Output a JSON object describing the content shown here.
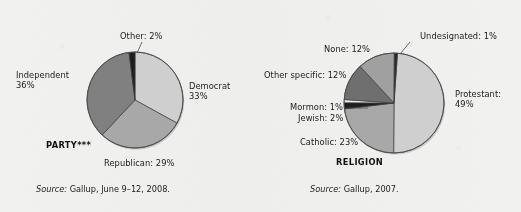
{
  "page": {
    "background_color": "#f1f1ef",
    "text_color": "#1b1b1b"
  },
  "charts": [
    {
      "id": "party",
      "title": "PARTY***",
      "source_prefix": "Source:",
      "source_text": "Gallup, June 9–12, 2008.",
      "center": {
        "x": 135,
        "y": 100
      },
      "radius": 48,
      "start_angle": -90,
      "slices": [
        {
          "label": "Democrat",
          "value": 33,
          "display": "Democrat",
          "percent_text": "33%",
          "color": "#cfcfcf"
        },
        {
          "label": "Republican",
          "value": 29,
          "display": "Republican: 29%",
          "percent_text": "29%",
          "color": "#a8a8a8"
        },
        {
          "label": "Independent",
          "value": 36,
          "display": "Independent",
          "percent_text": "36%",
          "color": "#808080"
        },
        {
          "label": "Other",
          "value": 2,
          "display": "Other: 2%",
          "percent_text": "2%",
          "color": "#1e1e1e"
        }
      ]
    },
    {
      "id": "religion",
      "title": "RELIGION",
      "source_prefix": "Source:",
      "source_text": "Gallup, 2007.",
      "center": {
        "x": 394,
        "y": 103
      },
      "radius": 50,
      "start_angle": -86,
      "slices": [
        {
          "label": "Protestant",
          "value": 49,
          "display": "Protestant:",
          "percent_text": "49%",
          "color": "#cfcfcf"
        },
        {
          "label": "Catholic",
          "value": 23,
          "display": "Catholic: 23%",
          "percent_text": "23%",
          "color": "#a8a8a8"
        },
        {
          "label": "Jewish",
          "value": 2,
          "display": "Jewish: 2%",
          "percent_text": "2%",
          "color": "#1e1e1e"
        },
        {
          "label": "Mormon",
          "value": 1,
          "display": "Mormon: 1%",
          "percent_text": "1%",
          "color": "#ededed"
        },
        {
          "label": "Other specific",
          "value": 12,
          "display": "Other specific: 12%",
          "percent_text": "12%",
          "color": "#6f6f6f"
        },
        {
          "label": "None",
          "value": 12,
          "display": "None: 12%",
          "percent_text": "12%",
          "color": "#a0a0a0"
        },
        {
          "label": "Undesignated",
          "value": 1,
          "display": "Undesignated: 1%",
          "percent_text": "1%",
          "color": "#2a2a2a"
        }
      ]
    }
  ],
  "chart_data": [
    {
      "type": "pie",
      "title": "PARTY***",
      "categories": [
        "Democrat",
        "Republican",
        "Independent",
        "Other"
      ],
      "values": [
        33,
        29,
        36,
        2
      ],
      "units": "percent",
      "labels": [
        "Democrat 33%",
        "Republican: 29%",
        "Independent 36%",
        "Other: 2%"
      ],
      "source": "Source: Gallup, June 9–12, 2008.",
      "legend": "none (direct labels)"
    },
    {
      "type": "pie",
      "title": "RELIGION",
      "categories": [
        "Protestant",
        "Catholic",
        "Jewish",
        "Mormon",
        "Other specific",
        "None",
        "Undesignated"
      ],
      "values": [
        49,
        23,
        2,
        1,
        12,
        12,
        1
      ],
      "units": "percent",
      "labels": [
        "Protestant: 49%",
        "Catholic: 23%",
        "Jewish: 2%",
        "Mormon: 1%",
        "Other specific: 12%",
        "None: 12%",
        "Undesignated: 1%"
      ],
      "source": "Source: Gallup, 2007.",
      "legend": "none (direct labels)"
    }
  ],
  "labels": {
    "party": {
      "other": "Other: 2%",
      "democrat_name": "Democrat",
      "democrat_pct": "33%",
      "independent_name": "Independent",
      "independent_pct": "36%",
      "republican": "Republican: 29%",
      "title": "PARTY***",
      "source_prefix": "Source:",
      "source_rest": "Gallup, June 9–12, 2008."
    },
    "religion": {
      "undesignated": "Undesignated: 1%",
      "none": "None: 12%",
      "other_specific": "Other specific: 12%",
      "mormon": "Mormon: 1%",
      "jewish": "Jewish: 2%",
      "catholic": "Catholic: 23%",
      "protestant_name": "Protestant:",
      "protestant_pct": "49%",
      "title": "RELIGION",
      "source_prefix": "Source:",
      "source_rest": "Gallup, 2007."
    }
  }
}
